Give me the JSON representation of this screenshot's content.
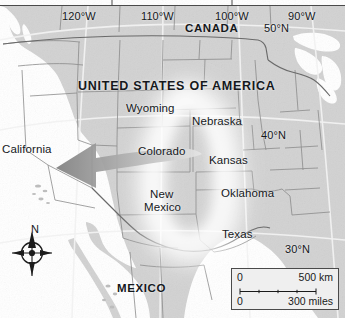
{
  "map": {
    "title": "UNITED STATES OF AMERICA",
    "colors": {
      "land": "#d2d2d2",
      "land_light": "#dcdcdc",
      "ocean": "#ffffff",
      "border_state": "#8e8e8e",
      "border_country": "#6d6d6d",
      "graticule": "#f4f4f4",
      "text": "#15181c",
      "arrow_dark": "#8a8a8a",
      "arrow_light": "#d8d8d8",
      "highlight_glow": "#ffffff",
      "frame": "#4a4a4a"
    },
    "countries": [
      {
        "name": "CANADA",
        "x": 185,
        "y": 22
      },
      {
        "name": "MEXICO",
        "x": 117,
        "y": 282
      }
    ],
    "states": [
      {
        "name": "California",
        "x": 2,
        "y": 143
      },
      {
        "name": "Wyoming",
        "x": 126,
        "y": 102
      },
      {
        "name": "Nebraska",
        "x": 192,
        "y": 115
      },
      {
        "name": "Colorado",
        "x": 138,
        "y": 145
      },
      {
        "name": "Kansas",
        "x": 209,
        "y": 154
      },
      {
        "name": "Oklahoma",
        "x": 221,
        "y": 187
      },
      {
        "name": "New",
        "x": 150,
        "y": 188
      },
      {
        "name": "Mexico",
        "x": 144,
        "y": 201
      },
      {
        "name": "Texas",
        "x": 222,
        "y": 228
      }
    ],
    "graticule_labels": [
      {
        "name": "120°W",
        "x": 62,
        "y": 10
      },
      {
        "name": "110°W",
        "x": 141,
        "y": 10
      },
      {
        "name": "100°W",
        "x": 215,
        "y": 10
      },
      {
        "name": "90°W",
        "x": 288,
        "y": 10
      },
      {
        "name": "50°N",
        "x": 264,
        "y": 22
      },
      {
        "name": "40°N",
        "x": 261,
        "y": 129
      },
      {
        "name": "30°N",
        "x": 285,
        "y": 243
      }
    ],
    "compass": {
      "label": "N",
      "x": 31,
      "y": 223
    },
    "scalebar": {
      "km_zero": "0",
      "km_value": "500 km",
      "miles_zero": "0",
      "miles_value": "300 miles"
    },
    "flow_arrow": {
      "name": "westward-flow-arrow",
      "direction": "west"
    }
  }
}
